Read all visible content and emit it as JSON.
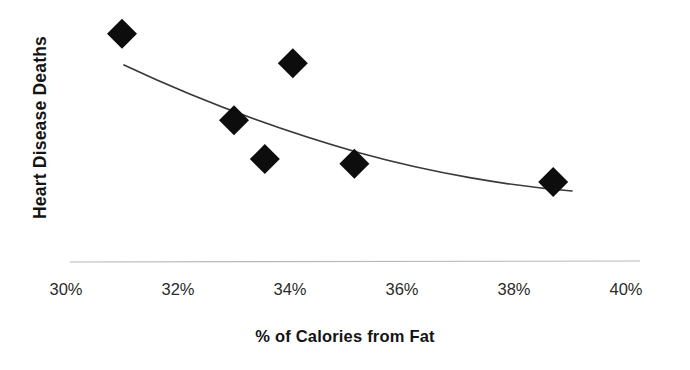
{
  "chart_data": {
    "type": "scatter",
    "title": "",
    "xlabel": "% of Calories from Fat",
    "ylabel": "Heart Disease Deaths",
    "xlim": [
      30,
      40
    ],
    "ylim": [
      0,
      1
    ],
    "grid": false,
    "legend": null,
    "x_tick_labels": [
      "30%",
      "32%",
      "34%",
      "36%",
      "38%",
      "40%"
    ],
    "x_ticks": [
      30,
      32,
      34,
      36,
      38,
      40
    ],
    "y_tick_labels": [],
    "marker": "diamond",
    "marker_color": "#0d0d0d",
    "points": [
      {
        "x": 31.0,
        "y": 0.94
      },
      {
        "x": 34.05,
        "y": 0.81
      },
      {
        "x": 33.0,
        "y": 0.56
      },
      {
        "x": 33.55,
        "y": 0.39
      },
      {
        "x": 35.15,
        "y": 0.37
      },
      {
        "x": 38.7,
        "y": 0.29
      }
    ],
    "trendline": {
      "type": "curve",
      "color": "#3a3a3a",
      "points": [
        {
          "x": 31.05,
          "y": 0.79
        },
        {
          "x": 33.0,
          "y": 0.6
        },
        {
          "x": 35.0,
          "y": 0.46
        },
        {
          "x": 37.0,
          "y": 0.36
        },
        {
          "x": 39.0,
          "y": 0.29
        }
      ]
    },
    "axis_line": {
      "color": "#b7b7b7",
      "x_start": 30.07,
      "x_end": 40.25
    }
  },
  "colors": {
    "background": "#ffffff",
    "marker": "#0d0d0d",
    "trendline": "#3a3a3a",
    "axis": "#b7b7b7",
    "text": "#141414"
  }
}
